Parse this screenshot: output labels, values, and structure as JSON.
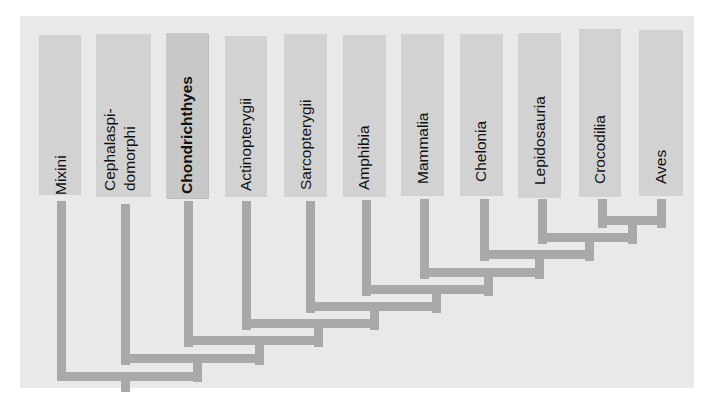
{
  "diagram": {
    "type": "cladogram",
    "colors": {
      "background": "#e9e9e9",
      "taxon_box": "#d2d2d2",
      "branch": "#a9a9a9",
      "text": "#111111"
    },
    "taxa": [
      {
        "label": "Mixini",
        "highlighted": false
      },
      {
        "label": "Cephalaspi-\ndomorphi",
        "line1": "Cephalaspi-",
        "line2": "domorphi",
        "highlighted": false
      },
      {
        "label": "Chondrichthyes",
        "highlighted": true
      },
      {
        "label": "Actinopterygii",
        "highlighted": false
      },
      {
        "label": "Sarcopterygii",
        "highlighted": false
      },
      {
        "label": "Amphibia",
        "highlighted": false
      },
      {
        "label": "Mammalia",
        "highlighted": false
      },
      {
        "label": "Chelonia",
        "highlighted": false
      },
      {
        "label": "Lepidosauria",
        "highlighted": false
      },
      {
        "label": "Crocodilia",
        "highlighted": false
      },
      {
        "label": "Aves",
        "highlighted": false
      }
    ],
    "clades": [
      [
        "Crocodilia",
        "Aves"
      ],
      [
        "Lepidosauria",
        [
          "Crocodilia",
          "Aves"
        ]
      ],
      [
        "Chelonia",
        "..."
      ],
      [
        "Mammalia",
        "..."
      ],
      [
        "Amphibia",
        "..."
      ],
      [
        "Sarcopterygii",
        "..."
      ],
      [
        "Actinopterygii",
        "..."
      ],
      [
        "Chondrichthyes",
        "..."
      ],
      [
        "Cephalaspidomorphi",
        "..."
      ],
      [
        "Mixini",
        "..."
      ]
    ]
  }
}
